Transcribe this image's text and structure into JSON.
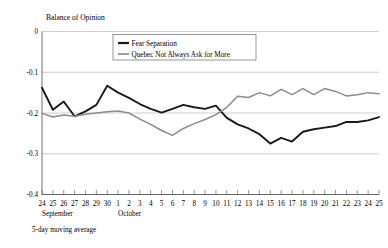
{
  "chart_data": {
    "type": "line",
    "title": "",
    "ylabel": "Balance of Opinion",
    "xlabel": "",
    "footnote": "5-day moving average",
    "ylim": [
      -0.4,
      0
    ],
    "yticks": [
      "0",
      "-0.1",
      "-0.2",
      "-0.3",
      "-0.4"
    ],
    "ytick_values": [
      0,
      -0.1,
      -0.2,
      -0.3,
      -0.4
    ],
    "grid": true,
    "legend_position": "upper-center",
    "x": [
      "24",
      "25",
      "26",
      "27",
      "28",
      "29",
      "30",
      "1",
      "2",
      "3",
      "4",
      "5",
      "6",
      "7",
      "8",
      "9",
      "10",
      "11",
      "12",
      "13",
      "14",
      "15",
      "16",
      "17",
      "18",
      "19",
      "20",
      "21",
      "22",
      "23",
      "24",
      "25"
    ],
    "month_groups": [
      {
        "label": "September",
        "start_index": 0,
        "end_index": 6
      },
      {
        "label": "October",
        "start_index": 7,
        "end_index": 31
      }
    ],
    "series": [
      {
        "name": "Fear Separation",
        "color": "#1a1a1a",
        "width": 1.9,
        "values": [
          -0.138,
          -0.192,
          -0.172,
          -0.208,
          -0.196,
          -0.18,
          -0.133,
          -0.15,
          -0.163,
          -0.178,
          -0.19,
          -0.199,
          -0.19,
          -0.18,
          -0.186,
          -0.19,
          -0.182,
          -0.212,
          -0.228,
          -0.238,
          -0.252,
          -0.275,
          -0.261,
          -0.27,
          -0.246,
          -0.24,
          -0.236,
          -0.232,
          -0.222,
          -0.222,
          -0.218,
          -0.21
        ]
      },
      {
        "name": "Quebec Not Always Ask for More",
        "color": "#8c8c8c",
        "width": 1.5,
        "values": [
          -0.201,
          -0.21,
          -0.205,
          -0.208,
          -0.203,
          -0.2,
          -0.197,
          -0.195,
          -0.2,
          -0.215,
          -0.228,
          -0.243,
          -0.255,
          -0.238,
          -0.226,
          -0.216,
          -0.204,
          -0.186,
          -0.159,
          -0.162,
          -0.15,
          -0.158,
          -0.142,
          -0.155,
          -0.14,
          -0.155,
          -0.14,
          -0.147,
          -0.158,
          -0.155,
          -0.15,
          -0.153
        ]
      }
    ]
  },
  "legend": {
    "entries": [
      {
        "label": "Fear Separation"
      },
      {
        "label": "Quebec Not Always Ask for More"
      }
    ]
  }
}
